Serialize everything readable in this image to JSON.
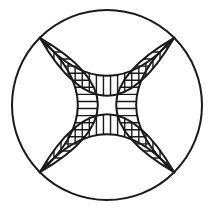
{
  "figure": {
    "type": "line-drawing",
    "background_color": "#ffffff",
    "stroke_color": "#1a1a1a",
    "fill_color": "#ffffff",
    "canvas": {
      "width": 220,
      "height": 222
    }
  },
  "geometry": {
    "center": {
      "x": 107,
      "y": 105
    },
    "outer_circle": {
      "name": "outer-circle",
      "radius": 95,
      "stroke_width": 2.0
    },
    "corner_angles_deg": [
      45,
      135,
      225,
      315
    ],
    "bands": [
      {
        "name": "top-band",
        "side": "top",
        "angle_deg": 270,
        "hatch_count": 19,
        "outer_arc_bulge": 38,
        "inner_arc_bulge": 20,
        "stroke_width": 2.0,
        "hatch_stroke_width": 1.4
      },
      {
        "name": "right-band",
        "side": "right",
        "angle_deg": 0,
        "hatch_count": 19,
        "outer_arc_bulge": 38,
        "inner_arc_bulge": 20,
        "stroke_width": 2.0,
        "hatch_stroke_width": 1.4
      },
      {
        "name": "bottom-band",
        "side": "bottom",
        "angle_deg": 90,
        "hatch_count": 19,
        "outer_arc_bulge": 38,
        "inner_arc_bulge": 20,
        "stroke_width": 2.0,
        "hatch_stroke_width": 1.4
      },
      {
        "name": "left-band",
        "side": "left",
        "angle_deg": 180,
        "hatch_count": 19,
        "outer_arc_bulge": 38,
        "inner_arc_bulge": 20,
        "stroke_width": 2.0,
        "hatch_stroke_width": 1.4
      }
    ],
    "lenses": [
      {
        "name": "top-lens",
        "side": "top"
      },
      {
        "name": "right-lens",
        "side": "right"
      },
      {
        "name": "bottom-lens",
        "side": "bottom"
      },
      {
        "name": "left-lens",
        "side": "left"
      }
    ],
    "center_panel": {
      "name": "center-panel",
      "description": "concave square formed by the four inner band arcs",
      "fill": "#ffffff"
    }
  },
  "labels": {
    "figure_caption": ""
  }
}
